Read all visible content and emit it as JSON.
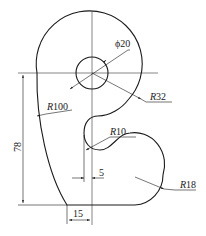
{
  "drawing": {
    "title": "",
    "colors": {
      "line": "#1a1a1a",
      "centerline": "#333333",
      "background": "#ffffff"
    },
    "dimensions": {
      "hole_diameter": {
        "prefix": "ϕ",
        "value": "20"
      },
      "outer_radius": {
        "prefix": "R",
        "value": "32"
      },
      "left_radius": {
        "prefix": "R",
        "value": "100"
      },
      "notch_radius": {
        "prefix": "R",
        "value": "10"
      },
      "lobe_radius": {
        "prefix": "R",
        "value": "18"
      },
      "height": {
        "value": "78"
      },
      "notch_offset": {
        "value": "5"
      },
      "base_offset": {
        "value": "15"
      }
    }
  }
}
